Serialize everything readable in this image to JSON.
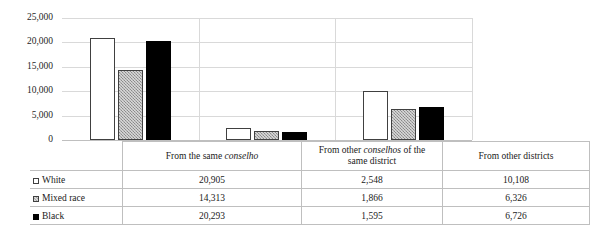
{
  "chart_data": {
    "type": "bar",
    "title": "",
    "subtitle": "",
    "xlabel": "",
    "ylabel": "",
    "grid": true,
    "legend_position": "table-left",
    "ylim": [
      0,
      25000
    ],
    "yticks": [
      "0",
      "5,000",
      "10,000",
      "15,000",
      "20,000",
      "25,000"
    ],
    "ytick_values": [
      0,
      5000,
      10000,
      15000,
      20000,
      25000
    ],
    "categories": [
      "From the same conselho",
      "From other conselhos of the same district",
      "From other districts"
    ],
    "category_labels_html": [
      "From the same <i>conselho</i>",
      "From other <i>conselhos</i> of the<br>same district",
      "From other districts"
    ],
    "series": [
      {
        "name": "White",
        "color": "#ffffff",
        "values": [
          20905,
          2548,
          10108
        ],
        "labels": [
          "20,905",
          "2,548",
          "10,108"
        ]
      },
      {
        "name": "Mixed race",
        "color": "#a6a6a6",
        "values": [
          14313,
          1866,
          6326
        ],
        "labels": [
          "14,313",
          "1,866",
          "6,326"
        ]
      },
      {
        "name": "Black",
        "color": "#000000",
        "values": [
          20293,
          1595,
          6726
        ],
        "labels": [
          "20,293",
          "1,595",
          "6,726"
        ]
      }
    ]
  },
  "table": {
    "row_headers": [
      "White",
      "Mixed race",
      "Black"
    ],
    "rows": [
      [
        "20,905",
        "2,548",
        "10,108"
      ],
      [
        "14,313",
        "1,866",
        "6,326"
      ],
      [
        "20,293",
        "1,595",
        "6,726"
      ]
    ]
  }
}
